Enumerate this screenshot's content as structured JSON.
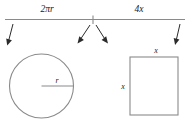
{
  "diagram": {
    "title_labels": {
      "left_segment": "2πr",
      "right_segment": "4x"
    },
    "shapes": {
      "circle": {
        "name": "circle",
        "radius_label": "r"
      },
      "square": {
        "name": "square",
        "top_label": "x",
        "left_label": "x"
      }
    },
    "colors": {
      "shape_stroke": "#8a8a8a",
      "arrow": "#2b2b2b",
      "text": "#1a1a1a",
      "background": "#ffffff"
    },
    "arrows": {
      "count": 4,
      "names": [
        "left-down-arrow",
        "center-left-arrow",
        "center-right-arrow",
        "right-down-arrow"
      ]
    }
  }
}
